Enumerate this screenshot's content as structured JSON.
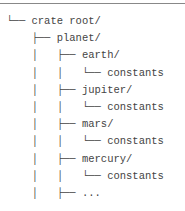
{
  "tree": {
    "rows": [
      {
        "prefix": " └── ",
        "label": "crate root/"
      },
      {
        "prefix": "     ├── ",
        "label": "planet/"
      },
      {
        "prefix": "     │   ├── ",
        "label": "earth/"
      },
      {
        "prefix": "     │   │   └── ",
        "label": "constants"
      },
      {
        "prefix": "     │   ├── ",
        "label": "jupiter/"
      },
      {
        "prefix": "     │   │   └── ",
        "label": "constants"
      },
      {
        "prefix": "     │   ├── ",
        "label": "mars/"
      },
      {
        "prefix": "     │   │   └── ",
        "label": "constants"
      },
      {
        "prefix": "     │   ├── ",
        "label": "mercury/"
      },
      {
        "prefix": "     │   │   └── ",
        "label": "constants"
      },
      {
        "prefix": "     │   ├── ",
        "label": "..."
      }
    ]
  }
}
